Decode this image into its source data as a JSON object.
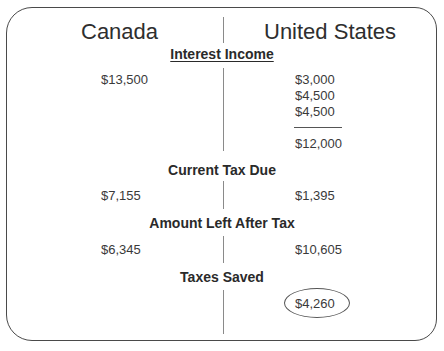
{
  "columns": {
    "left": "Canada",
    "right": "United States"
  },
  "sections": [
    {
      "title": "Interest Income",
      "underlined": true,
      "canada": [
        "$13,500"
      ],
      "us": [
        "$3,000",
        "$4,500",
        "$4,500"
      ],
      "us_total": "$12,000"
    },
    {
      "title": "Current Tax Due",
      "canada": [
        "$7,155"
      ],
      "us": [
        "$1,395"
      ]
    },
    {
      "title": "Amount Left After Tax",
      "canada": [
        "$6,345"
      ],
      "us": [
        "$10,605"
      ]
    },
    {
      "title": "Taxes Saved",
      "canada": [],
      "us": [
        "$4,260"
      ],
      "highlighted": "circled"
    }
  ],
  "colors": {
    "frame": "#4a4a4a",
    "divider": "#8a8a8a",
    "text": "#2a2a2a"
  }
}
